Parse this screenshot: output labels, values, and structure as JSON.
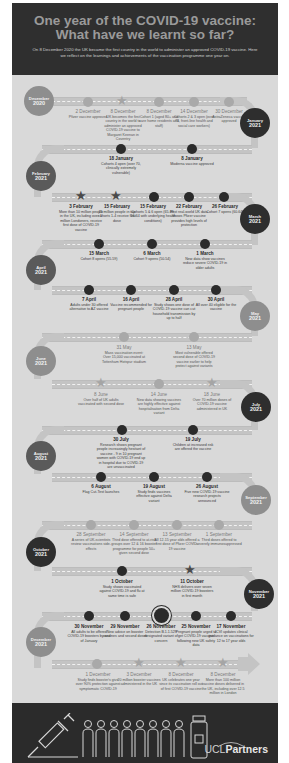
{
  "header": {
    "title_line1": "One year of the COVID-19 vaccine:",
    "title_line2": "What have we learnt so far?",
    "intro": "On 8 December 2020 the UK became the first country in the world to administer an approved COVID-19 vaccine. Here we reflect on the learnings and achievements of the vaccination programme one year on."
  },
  "months": [
    {
      "label": "December",
      "year": "2020"
    },
    {
      "label": "January",
      "year": "2021"
    },
    {
      "label": "February",
      "year": "2021"
    },
    {
      "label": "March",
      "year": "2021"
    },
    {
      "label": "April",
      "year": "2021"
    },
    {
      "label": "May",
      "year": "2021"
    },
    {
      "label": "June",
      "year": "2021"
    },
    {
      "label": "July",
      "year": "2021"
    },
    {
      "label": "August",
      "year": "2021"
    },
    {
      "label": "September",
      "year": "2021"
    },
    {
      "label": "October",
      "year": "2021"
    },
    {
      "label": "November",
      "year": "2021"
    },
    {
      "label": "December",
      "year": "2021"
    }
  ],
  "events": {
    "dec2020": [
      {
        "date": "2 December",
        "text": "Pfizer vaccine approved"
      },
      {
        "date": "8 December",
        "text": "UK becomes the first country in the world to administer an approved COVID-19 vaccine to Margaret Keenan in Coventry"
      },
      {
        "date": "8 December",
        "text": "Cohort 1 (aged 80+ and care home residents and staff)"
      },
      {
        "date": "14 December",
        "text": "Cohorts 2 & 3 open (over 75, front-line health and social care workers)"
      },
      {
        "date": "30 December",
        "text": "AstraZeneca vaccine approved"
      }
    ],
    "jan2021": [
      {
        "date": "18 January",
        "text": "Cohorts 4 open (over 70, clinically extremely vulnerable)"
      },
      {
        "date": "8 January",
        "text": "Moderna vaccine approved"
      }
    ],
    "feb2021": [
      {
        "date": "3 February",
        "text": "More than 10 million people in the UK, including over 1 million Londoners, receive first dose of COVID-19 vaccine"
      },
      {
        "date": "15 February",
        "text": "15 million people in top cohorts 1-4 receive first dose"
      },
      {
        "date": "15 February",
        "text": "Cohorts 5 & 6 open (65-69, 16-64 with underlying health conditions)"
      },
      {
        "date": "22 February",
        "text": "First real-world UK data shows Pfizer vaccine provides high levels of protection"
      },
      {
        "date": "26 February",
        "text": "Cohort 7 opens (60-64)"
      }
    ],
    "mar2021": [
      {
        "date": "15 March",
        "text": "Cohort 8 opens (55-59)"
      },
      {
        "date": "6 March",
        "text": "Cohort 9 opens (50-54)"
      },
      {
        "date": "1 March",
        "text": "New data show vaccines reduce severe COVID-19 in older adults"
      }
    ],
    "apr2021": [
      {
        "date": "7 April",
        "text": "Adults under 30 offered alternative to AZ vaccine"
      },
      {
        "date": "16 April",
        "text": "Vaccine recommended for pregnant people"
      },
      {
        "date": "28 April",
        "text": "Study shows one dose of COVID-19 vaccine can cut household transmission by up to half"
      },
      {
        "date": "30 April",
        "text": "All over 40 eligible for the vaccine"
      }
    ],
    "may2021": [
      {
        "date": "31 May",
        "text": "Mass vaccination event: Over 15,000 vaccinated at Tottenham Hotspur stadium"
      },
      {
        "date": "13 May",
        "text": "Most vulnerable offered second dose of COVID-19 vaccine earlier to help protect against variants"
      }
    ],
    "jun2021": [
      {
        "date": "8 June",
        "text": "Over half of UK adults vaccinated with second dose"
      },
      {
        "date": "14 June",
        "text": "New data showing vaccines are highly effective against hospitalisation from Delta variant"
      },
      {
        "date": "18 June",
        "text": "Over 70 million doses of COVID-19 vaccine administered in UK"
      }
    ],
    "jul2021": [
      {
        "date": "30 July",
        "text": "Research shows pregnant people increasingly hesitant of vaccine - 9 in 10 pregnant women with COVID-19 end up in hospital due to COVID-19 are unvaccinated"
      },
      {
        "date": "19 July",
        "text": "Children at increased risk are offered the vaccine"
      }
    ],
    "aug2021": [
      {
        "date": "6 August",
        "text": "Flag Cut-Test launches"
      },
      {
        "date": "19 August",
        "text": "Study finds vaccines effective against Delta variant"
      },
      {
        "date": "26 August",
        "text": "Five new COVID-19 vaccine research projects announced"
      }
    ],
    "sep2021": [
      {
        "date": "28 September",
        "text": "A series of UK-scientists review vaccinations side-effects"
      },
      {
        "date": "14 September",
        "text": "Third dose offered to at-risk groups over 12 & 16 booster programme for people 50+ given second dose"
      },
      {
        "date": "13 September",
        "text": "All 12-15 year olds offered a first dose of Pfizer COVID-19 vaccine"
      },
      {
        "date": "1 September",
        "text": "Third doses offered to severely immunosuppressed"
      }
    ],
    "oct2021": [
      {
        "date": "1 October",
        "text": "Study shows vaccinated against COVID-19 and flu at same time is safe"
      },
      {
        "date": "11 October",
        "text": "NHS delivers over seven million COVID-19 boosters in first month"
      }
    ],
    "nov2021": [
      {
        "date": "30 November",
        "text": "All adults to be offered COVID-19 boosters by end of January"
      },
      {
        "date": "29 November",
        "text": "New advice on booster vaccines and second doses"
      },
      {
        "date": "26 November",
        "text": "Detection B.1.1.529 designated variant of concern"
      },
      {
        "date": "25 November",
        "text": "Pregnant people urged to get COVID-19 vaccine following new UK safety data"
      },
      {
        "date": "17 November",
        "text": "JCVI updates clinical guidance on vaccinations for 12 to 17 year olds"
      }
    ],
    "dec2021": [
      {
        "date": "1 December",
        "text": "Study finds booster's give over 90% protection against symptomatic COVID-19"
      },
      {
        "date": "3 December",
        "text": "20 million booster vaccines administered in the UK"
      },
      {
        "date": "8 December",
        "text": "UK celebrates one year since its vaccination roll out of first COVID-19 vaccine"
      },
      {
        "date": "8 December",
        "text": "More than 100 million vaccine doses delivered in the UK, including over 12.5 million in London"
      }
    ]
  },
  "footer": {
    "brand_prefix": "UCL",
    "brand_suffix": "Partners",
    "people_count": 8
  },
  "colors": {
    "header_bg": "#2f2f2f",
    "poster_bg": "#d9d9d9",
    "dark_marker": "#2b2b2b",
    "light_marker": "#a9a9a9",
    "footer_bg": "#2b2b2b"
  }
}
